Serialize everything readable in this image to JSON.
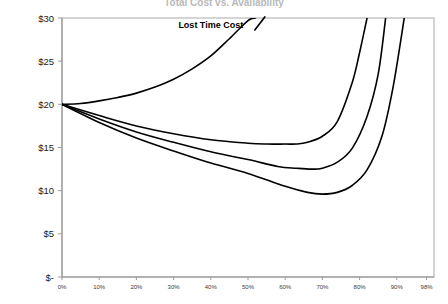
{
  "chart_data": {
    "type": "line",
    "title": "Total Cost vs. Availability",
    "xlabel": "",
    "ylabel": "",
    "grid": false,
    "legend_position": "inline-annotation",
    "x_tick_labels": [
      "0%",
      "10%",
      "20%",
      "30%",
      "40%",
      "50%",
      "60%",
      "70%",
      "80%",
      "90%",
      "98%"
    ],
    "x_tick_values": [
      0,
      10,
      20,
      30,
      40,
      50,
      60,
      70,
      80,
      90,
      98
    ],
    "y_tick_labels": [
      "$-",
      "$5",
      "$10",
      "$15",
      "$20",
      "$25",
      "$30"
    ],
    "y_tick_values": [
      0,
      5,
      10,
      15,
      20,
      25,
      30
    ],
    "xlim": [
      0,
      100
    ],
    "ylim": [
      0,
      30
    ],
    "annotations": [
      {
        "text": "Lost Time Cost",
        "x": 40,
        "y": 29.2
      }
    ],
    "series": [
      {
        "name": "Lost Time Cost",
        "x": [
          0,
          5,
          10,
          15,
          20,
          25,
          30,
          35,
          40,
          45,
          50,
          52
        ],
        "y": [
          20.0,
          20.1,
          20.4,
          20.8,
          21.3,
          22.0,
          22.9,
          24.1,
          25.6,
          27.6,
          29.7,
          30.0
        ]
      },
      {
        "name": "Total Cost A",
        "x": [
          0,
          10,
          20,
          30,
          40,
          50,
          55,
          60,
          63,
          66,
          70,
          74,
          78,
          80,
          82
        ],
        "y": [
          20.0,
          18.7,
          17.5,
          16.6,
          15.9,
          15.5,
          15.4,
          15.4,
          15.4,
          15.6,
          16.3,
          18.0,
          22.5,
          26.0,
          30.0
        ]
      },
      {
        "name": "Total Cost B",
        "x": [
          0,
          10,
          20,
          30,
          40,
          50,
          58,
          63,
          67,
          70,
          74,
          78,
          82,
          85,
          87
        ],
        "y": [
          20.0,
          18.3,
          16.8,
          15.6,
          14.5,
          13.6,
          12.8,
          12.6,
          12.5,
          12.6,
          13.3,
          14.9,
          18.6,
          23.5,
          30.0
        ]
      },
      {
        "name": "Total Cost C",
        "x": [
          0,
          10,
          20,
          30,
          40,
          50,
          60,
          66,
          70,
          74,
          78,
          82,
          86,
          89,
          92
        ],
        "y": [
          20.0,
          17.9,
          16.1,
          14.6,
          13.2,
          12.0,
          10.5,
          9.8,
          9.6,
          9.8,
          10.6,
          12.4,
          16.3,
          22.0,
          30.0
        ]
      }
    ]
  }
}
